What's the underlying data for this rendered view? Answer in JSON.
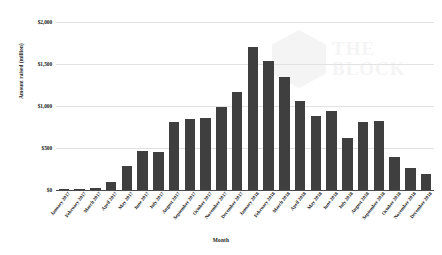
{
  "watermark": {
    "line1": "THE",
    "line2": "BLOCK",
    "logo_icon": "hexagon-logo-icon"
  },
  "chart_data": {
    "type": "bar",
    "title": "",
    "xlabel": "Month",
    "ylabel": "Amount raised (million)",
    "ylim": [
      0,
      2000
    ],
    "ytick_labels": [
      "$2,000",
      "$1,500",
      "$1,000",
      "$500",
      "$0"
    ],
    "ytick_values": [
      2000,
      1500,
      1000,
      500,
      0
    ],
    "grid": true,
    "legend": "none",
    "bar_color": "#3f3f3f",
    "categories": [
      "January 2017",
      "February 2017",
      "March 2017",
      "April 2017",
      "May 2017",
      "June 2017",
      "July 2017",
      "August 2017",
      "September 2017",
      "October 2017",
      "November 2017",
      "December 2017",
      "January 2018",
      "February 2018",
      "March 2018",
      "April 2018",
      "May 2018",
      "June 2018",
      "July 2018",
      "August 2018",
      "September 2018",
      "October 2018",
      "November 2018",
      "December 2018"
    ],
    "values": [
      6,
      10,
      20,
      95,
      290,
      470,
      450,
      810,
      840,
      860,
      990,
      1170,
      1700,
      1530,
      1350,
      1060,
      880,
      940,
      620,
      810,
      820,
      390,
      260,
      190
    ]
  }
}
